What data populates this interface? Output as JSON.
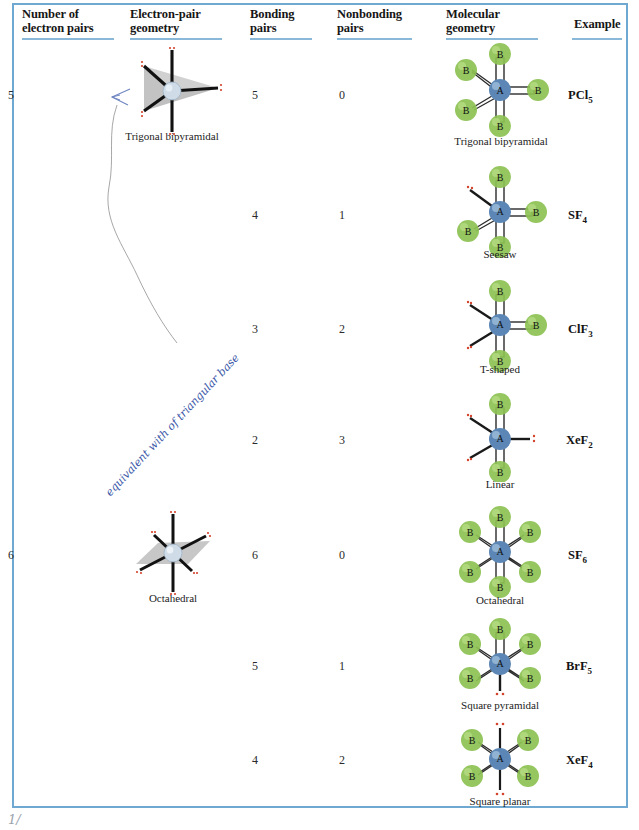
{
  "table": {
    "title": "VSEPR molecular geometry table",
    "border_color": "#6fa8d0",
    "header_rule_color": "#8ab8d8",
    "columns": [
      {
        "id": "electron-pairs",
        "label_line1": "Number of",
        "label_line2": "electron pairs"
      },
      {
        "id": "electron-pair-geometry",
        "label_line1": "Electron-pair",
        "label_line2": "geometry"
      },
      {
        "id": "bonding-pairs",
        "label_line1": "Bonding",
        "label_line2": "pairs"
      },
      {
        "id": "nonbonding-pairs",
        "label_line1": "Nonbonding",
        "label_line2": "pairs"
      },
      {
        "id": "molecular-geometry",
        "label_line1": "Molecular",
        "label_line2": "geometry"
      },
      {
        "id": "example",
        "label_line1": "Example",
        "label_line2": ""
      }
    ],
    "rows": [
      {
        "electron_pairs": "5",
        "electron_pair_geometry": "Trigonal bipyramidal",
        "bonding_pairs": "5",
        "nonbonding_pairs": "0",
        "molecular_geometry": "Trigonal bipyramidal",
        "example": "PCl",
        "example_sub": "5"
      },
      {
        "electron_pairs": "",
        "electron_pair_geometry": "",
        "bonding_pairs": "4",
        "nonbonding_pairs": "1",
        "molecular_geometry": "Seesaw",
        "example": "SF",
        "example_sub": "4"
      },
      {
        "electron_pairs": "",
        "electron_pair_geometry": "",
        "bonding_pairs": "3",
        "nonbonding_pairs": "2",
        "molecular_geometry": "T-shaped",
        "example": "ClF",
        "example_sub": "3"
      },
      {
        "electron_pairs": "",
        "electron_pair_geometry": "",
        "bonding_pairs": "2",
        "nonbonding_pairs": "3",
        "molecular_geometry": "Linear",
        "example": "XeF",
        "example_sub": "2"
      },
      {
        "electron_pairs": "6",
        "electron_pair_geometry": "Octahedral",
        "bonding_pairs": "6",
        "nonbonding_pairs": "0",
        "molecular_geometry": "Octahedral",
        "example": "SF",
        "example_sub": "6"
      },
      {
        "electron_pairs": "",
        "electron_pair_geometry": "",
        "bonding_pairs": "5",
        "nonbonding_pairs": "1",
        "molecular_geometry": "Square pyramidal",
        "example": "BrF",
        "example_sub": "5"
      },
      {
        "electron_pairs": "",
        "electron_pair_geometry": "",
        "bonding_pairs": "4",
        "nonbonding_pairs": "2",
        "molecular_geometry": "Square planar",
        "example": "XeF",
        "example_sub": "4"
      }
    ]
  },
  "atoms": {
    "central_label": "A",
    "ligand_label": "B",
    "central_color": "#5b86b5",
    "ligand_color": "#8cc152",
    "lone_pair_color": "#d4442c"
  },
  "annotations": {
    "handwriting": "equivalent with of triangular base",
    "corner_mark": "1/"
  }
}
